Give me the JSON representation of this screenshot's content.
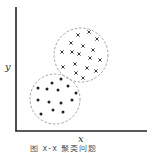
{
  "figure": {
    "xlabel": "x",
    "ylabel": "y",
    "caption": "图 x-x  聚类问题"
  },
  "colors": {
    "axis": "#222222",
    "circle": "#999999",
    "marker": "#222222"
  },
  "chart_data": {
    "type": "scatter",
    "title": "",
    "xlabel": "x",
    "ylabel": "y",
    "grid": false,
    "series": [
      {
        "name": "cluster-crosses",
        "marker": "x",
        "points": [
          [
            78,
            35
          ],
          [
            89,
            32
          ],
          [
            97,
            39
          ],
          [
            71,
            43
          ],
          [
            83,
            46
          ],
          [
            93,
            50
          ],
          [
            62,
            52
          ],
          [
            72,
            52
          ],
          [
            79,
            54
          ],
          [
            90,
            58
          ],
          [
            100,
            60
          ],
          [
            75,
            64
          ],
          [
            63,
            67
          ],
          [
            87,
            68
          ],
          [
            96,
            71
          ],
          [
            76,
            73
          ],
          [
            83,
            78
          ]
        ],
        "boundary": {
          "cx": 81,
          "cy": 55,
          "r": 27
        }
      },
      {
        "name": "cluster-dots",
        "marker": "dot",
        "points": [
          [
            52,
            83
          ],
          [
            61,
            79
          ],
          [
            38,
            88
          ],
          [
            47,
            89
          ],
          [
            58,
            90
          ],
          [
            68,
            86
          ],
          [
            76,
            93
          ],
          [
            38,
            100
          ],
          [
            49,
            102
          ],
          [
            61,
            103
          ],
          [
            72,
            100
          ],
          [
            53,
            110
          ],
          [
            63,
            112
          ],
          [
            41,
            114
          ]
        ],
        "boundary": {
          "cx": 55,
          "cy": 99,
          "r": 25
        }
      }
    ]
  }
}
